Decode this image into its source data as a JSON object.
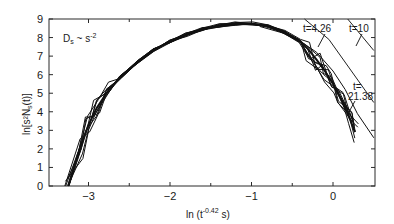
{
  "chart_data": {
    "type": "line",
    "title": "",
    "xlabel": "ln (t^-0.42 s)",
    "ylabel": "ln[s^2 N_s(t)]",
    "xlim": [
      -3.5,
      0.52
    ],
    "ylim": [
      0,
      9
    ],
    "x_ticks": [
      -3,
      -2,
      -1,
      0
    ],
    "x_minor_ticks": [
      -2.5,
      -1.5,
      -0.5
    ],
    "y_ticks": [
      0,
      1,
      2,
      3,
      4,
      5,
      6,
      7,
      8,
      9
    ],
    "grid": false,
    "legend": null,
    "annotations": [
      {
        "text": "D_s ~ s^-2",
        "x": -3.2,
        "y": 8.2
      },
      {
        "text": "t=4.26",
        "x": -0.1,
        "y": 8.6
      },
      {
        "text": "t=10",
        "x": 0.35,
        "y": 8.6
      },
      {
        "text": "t=",
        "x": 0.25,
        "y": 5.1
      },
      {
        "text": "21.38",
        "x": 0.25,
        "y": 4.5
      }
    ],
    "series": [
      {
        "name": "scaling collapse (t=21.38 family, superimposed curves)",
        "x": [
          -3.25,
          -3.1,
          -3.0,
          -2.9,
          -2.75,
          -2.6,
          -2.4,
          -2.2,
          -2.0,
          -1.8,
          -1.6,
          -1.4,
          -1.2,
          -1.0,
          -0.8,
          -0.6,
          -0.4,
          -0.3,
          -0.2,
          -0.1,
          0.0,
          0.1,
          0.2,
          0.27
        ],
        "y": [
          0.0,
          2.0,
          3.3,
          4.2,
          5.2,
          5.9,
          6.7,
          7.3,
          7.8,
          8.15,
          8.45,
          8.65,
          8.75,
          8.75,
          8.6,
          8.3,
          7.8,
          7.35,
          6.8,
          6.2,
          5.5,
          4.7,
          3.7,
          2.9
        ]
      },
      {
        "name": "t=4.26",
        "x": [
          -0.35,
          -0.05,
          0.5
        ],
        "y": [
          9.0,
          7.9,
          4.5
        ]
      },
      {
        "name": "t=10",
        "x": [
          0.18,
          0.5
        ],
        "y": [
          9.0,
          7.3
        ]
      }
    ]
  },
  "labels": {
    "y_axis": "ln[s²N",
    "y_axis_sub": "s",
    "y_axis_tail": "(t)]",
    "x_axis_prefix": "ln (t",
    "x_axis_exp": "-0.42",
    "x_axis_suffix": " s)",
    "ds_label": "D",
    "ds_sub": "s",
    "ds_rel": " ~ s",
    "ds_exp": "-2",
    "t426": "t=4.26",
    "t10": "t=10",
    "t2138_a": "t=",
    "t2138_b": "21.38"
  }
}
